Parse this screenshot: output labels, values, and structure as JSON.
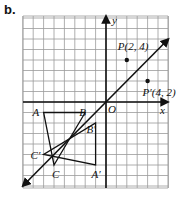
{
  "part_label": "b.",
  "axes": {
    "x_label": "x",
    "y_label": "y",
    "origin_label": "O",
    "x_range": [
      -8,
      6
    ],
    "y_range": [
      -8.2,
      8.2
    ]
  },
  "mirror_line": {
    "equation": "y = x",
    "from": [
      -8,
      -8
    ],
    "to": [
      6,
      6
    ]
  },
  "points": [
    {
      "name": "P",
      "label": "P(2, 4)",
      "x": 2,
      "y": 4
    },
    {
      "name": "P'",
      "label": "P′(4, 2)",
      "x": 4,
      "y": 2
    }
  ],
  "triangles": [
    {
      "name": "ABC",
      "vertices": [
        {
          "label": "A",
          "x": -6,
          "y": -1
        },
        {
          "label": "B",
          "x": -2,
          "y": -1
        },
        {
          "label": "C",
          "x": -5,
          "y": -6
        }
      ]
    },
    {
      "name": "A'B'C'",
      "vertices": [
        {
          "label": "A′",
          "x": -1,
          "y": -6
        },
        {
          "label": "B′",
          "x": -1,
          "y": -2
        },
        {
          "label": "C′",
          "x": -6,
          "y": -5
        }
      ]
    }
  ]
}
